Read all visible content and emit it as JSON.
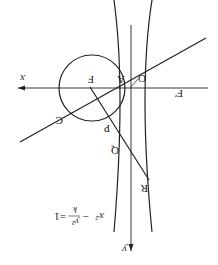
{
  "diagram": {
    "orientation": "rotated-180",
    "axes": {
      "x_label": "x",
      "y_label": "y",
      "origin_label": "O"
    },
    "points": {
      "A": "A",
      "F": "F",
      "F_prime": "F′",
      "P": "P",
      "Q": "Q",
      "R": "R"
    },
    "circle_label": "C",
    "equation": {
      "lhs_term1": "x²",
      "minus": "−",
      "frac_num": "y²",
      "frac_den": "k",
      "equals": "=1"
    },
    "colors": {
      "stroke": "#222222",
      "background": "#ffffff"
    }
  }
}
